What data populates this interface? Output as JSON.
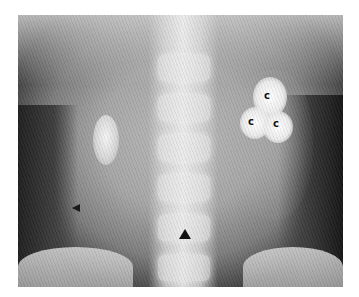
{
  "image": {
    "type": "abdominal radiograph",
    "annotations": {
      "calculus_labels": [
        {
          "text": "c",
          "x": 267,
          "y": 97
        },
        {
          "text": "c",
          "x": 251,
          "y": 123
        },
        {
          "text": "c",
          "x": 276,
          "y": 125
        }
      ],
      "arrowheads": [
        {
          "direction": "up",
          "x": 185,
          "y": 234
        },
        {
          "direction": "left",
          "x": 76,
          "y": 208
        }
      ]
    },
    "colors": {
      "background": "#ffffff",
      "marker": "#111111"
    }
  }
}
